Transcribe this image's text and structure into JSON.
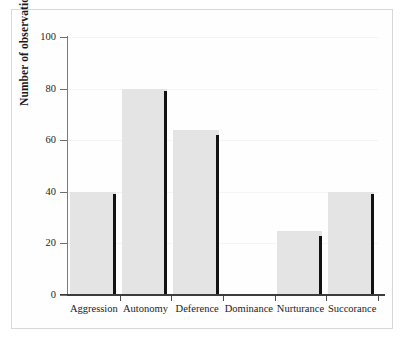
{
  "chart_data": {
    "type": "bar",
    "title": "",
    "xlabel": "",
    "ylabel": "Number of observations",
    "categories": [
      "Aggression",
      "Autonomy",
      "Deference",
      "Dominance",
      "Nurturance",
      "Succorance"
    ],
    "values": [
      40,
      80,
      64,
      0,
      25,
      40
    ],
    "marker_values": [
      39,
      79,
      62,
      0,
      23,
      39
    ],
    "ylim": [
      0,
      100
    ],
    "yticks": [
      0,
      20,
      40,
      60,
      80,
      100
    ],
    "ytick_labels": [
      "0",
      "20",
      "40",
      "60",
      "80",
      "100"
    ],
    "grid": true,
    "legend": "none",
    "series": [
      {
        "name": "Number of observations",
        "values": [
          40,
          80,
          64,
          0,
          25,
          40
        ]
      }
    ]
  },
  "style": {
    "bar_fill": "#e4e4e4",
    "bar_edge": "#121212",
    "axis_color": "#3c3c3c",
    "grid_color": "#f4f4f4",
    "text_color": "#1b1b1b",
    "frame_color": "#d8d8d8",
    "background": "#ffffff"
  }
}
